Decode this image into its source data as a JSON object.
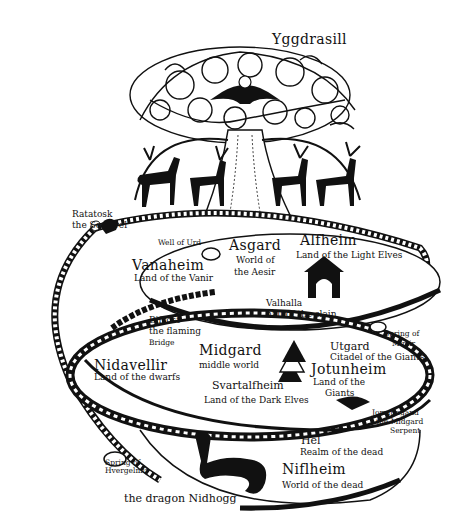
{
  "title": "Yggdrasill",
  "colors": {
    "ink": "#111111",
    "paper": "#ffffff"
  },
  "labels": {
    "ratatosk": {
      "name": "Ratatosk",
      "desc": "the Squirrel"
    },
    "well_of_urd": "Well of Urd",
    "asgard": {
      "name": "Asgard",
      "desc1": "World of",
      "desc2": "the Aesir"
    },
    "alfheim": {
      "name": "Alfheim",
      "desc": "Land of the Light Elves"
    },
    "vanaheim": {
      "name": "Vanaheim",
      "desc": "Land of the Vanir"
    },
    "valhalla": {
      "name": "Valhalla",
      "desc": "hall of the slain"
    },
    "bifrost": {
      "name": "Bifrost",
      "desc1": "the flaming",
      "desc2": "Bridge"
    },
    "spring_mimir": {
      "line1": "Spring of",
      "line2": "Mimir"
    },
    "midgard": {
      "name": "Midgard",
      "desc": "middle world"
    },
    "nidavellir": {
      "name": "Nidavellir",
      "desc": "Land of the dwarfs"
    },
    "utgard": {
      "name": "Utgard",
      "desc": "Citadel of the Giants"
    },
    "jotunheim": {
      "name": "Jotunheim",
      "desc1": "Land of the",
      "desc2": "Giants"
    },
    "svartalfheim": {
      "name": "Svartalfheim",
      "desc": "Land of the Dark Elves"
    },
    "jormungand": {
      "name": "Jormungand",
      "desc1": "the Midgard",
      "desc2": "Serpent"
    },
    "hel": {
      "name": "Hel",
      "desc": "Realm of the dead"
    },
    "spring_hvergelmir": {
      "line1": "Spring of",
      "line2": "Hvergelmir"
    },
    "niflheim": {
      "name": "Niflheim",
      "desc": "World of the dead"
    },
    "nidhogg": "the dragon Nidhogg"
  }
}
